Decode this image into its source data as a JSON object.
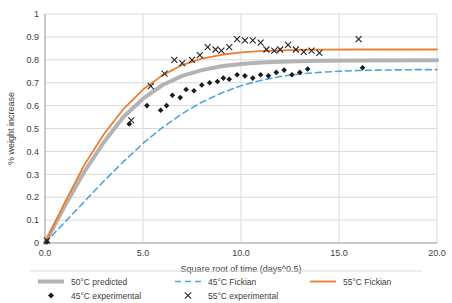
{
  "chart_data": {
    "type": "line",
    "title": "",
    "xlabel": "Square root of time (days^0.5)",
    "ylabel": "% weight increase",
    "xlim": [
      0.0,
      20.0
    ],
    "ylim": [
      0,
      1
    ],
    "xticks": [
      "0.0",
      "5.0",
      "10.0",
      "15.0",
      "20.0"
    ],
    "yticks": [
      "0",
      "0.1",
      "0.2",
      "0.3",
      "0.4",
      "0.5",
      "0.6",
      "0.7",
      "0.8",
      "0.9",
      "1"
    ],
    "grid": true,
    "legend_position": "bottom",
    "series": [
      {
        "name": "50°C predicted",
        "kind": "line",
        "color": "#b3b3b3",
        "width": 4,
        "points": [
          [
            0.0,
            0.0
          ],
          [
            1.0,
            0.16
          ],
          [
            2.0,
            0.31
          ],
          [
            3.0,
            0.44
          ],
          [
            4.0,
            0.55
          ],
          [
            5.0,
            0.63
          ],
          [
            6.0,
            0.69
          ],
          [
            7.0,
            0.73
          ],
          [
            8.0,
            0.755
          ],
          [
            9.0,
            0.772
          ],
          [
            10.0,
            0.782
          ],
          [
            11.0,
            0.788
          ],
          [
            12.0,
            0.792
          ],
          [
            13.0,
            0.794
          ],
          [
            14.0,
            0.796
          ],
          [
            16.0,
            0.797
          ],
          [
            20.0,
            0.798
          ]
        ]
      },
      {
        "name": "45°C Fickian",
        "kind": "dashed-line",
        "color": "#4ea6dc",
        "width": 1.6,
        "points": [
          [
            0.0,
            0.0
          ],
          [
            1.0,
            0.09
          ],
          [
            2.0,
            0.18
          ],
          [
            3.0,
            0.27
          ],
          [
            4.0,
            0.355
          ],
          [
            5.0,
            0.435
          ],
          [
            6.0,
            0.505
          ],
          [
            7.0,
            0.565
          ],
          [
            8.0,
            0.615
          ],
          [
            9.0,
            0.655
          ],
          [
            10.0,
            0.687
          ],
          [
            11.0,
            0.71
          ],
          [
            12.0,
            0.727
          ],
          [
            13.0,
            0.738
          ],
          [
            14.0,
            0.745
          ],
          [
            15.0,
            0.75
          ],
          [
            16.0,
            0.753
          ],
          [
            17.0,
            0.755
          ],
          [
            18.0,
            0.756
          ],
          [
            19.0,
            0.757
          ],
          [
            20.0,
            0.757
          ]
        ]
      },
      {
        "name": "55°C Fickian",
        "kind": "line",
        "color": "#ed7d31",
        "width": 1.8,
        "points": [
          [
            0.0,
            0.0
          ],
          [
            1.0,
            0.175
          ],
          [
            2.0,
            0.34
          ],
          [
            3.0,
            0.475
          ],
          [
            4.0,
            0.585
          ],
          [
            5.0,
            0.67
          ],
          [
            6.0,
            0.733
          ],
          [
            7.0,
            0.777
          ],
          [
            8.0,
            0.805
          ],
          [
            9.0,
            0.822
          ],
          [
            10.0,
            0.832
          ],
          [
            11.0,
            0.838
          ],
          [
            12.0,
            0.841
          ],
          [
            13.0,
            0.843
          ],
          [
            14.0,
            0.844
          ],
          [
            16.0,
            0.845
          ],
          [
            20.0,
            0.845
          ]
        ]
      },
      {
        "name": "45°C experimental",
        "kind": "scatter",
        "marker": "diamond",
        "color": "#1a1a1a",
        "points": [
          [
            0.1,
            0.005
          ],
          [
            4.3,
            0.52
          ],
          [
            5.2,
            0.6
          ],
          [
            5.9,
            0.58
          ],
          [
            6.2,
            0.6
          ],
          [
            6.5,
            0.645
          ],
          [
            6.9,
            0.635
          ],
          [
            7.2,
            0.67
          ],
          [
            7.6,
            0.665
          ],
          [
            8.0,
            0.69
          ],
          [
            8.4,
            0.7
          ],
          [
            8.8,
            0.705
          ],
          [
            9.1,
            0.72
          ],
          [
            9.4,
            0.715
          ],
          [
            9.8,
            0.735
          ],
          [
            10.2,
            0.73
          ],
          [
            10.6,
            0.72
          ],
          [
            11.0,
            0.735
          ],
          [
            11.4,
            0.73
          ],
          [
            11.8,
            0.745
          ],
          [
            12.2,
            0.755
          ],
          [
            12.6,
            0.735
          ],
          [
            13.0,
            0.745
          ],
          [
            13.4,
            0.76
          ],
          [
            16.2,
            0.765
          ]
        ]
      },
      {
        "name": "55°C experimental",
        "kind": "scatter",
        "marker": "cross",
        "color": "#262626",
        "points": [
          [
            0.1,
            0.01
          ],
          [
            4.4,
            0.535
          ],
          [
            5.4,
            0.685
          ],
          [
            6.1,
            0.74
          ],
          [
            6.6,
            0.8
          ],
          [
            7.0,
            0.785
          ],
          [
            7.5,
            0.8
          ],
          [
            7.9,
            0.82
          ],
          [
            8.3,
            0.855
          ],
          [
            8.7,
            0.845
          ],
          [
            9.0,
            0.84
          ],
          [
            9.4,
            0.855
          ],
          [
            9.8,
            0.89
          ],
          [
            10.2,
            0.885
          ],
          [
            10.6,
            0.885
          ],
          [
            11.0,
            0.875
          ],
          [
            11.3,
            0.845
          ],
          [
            11.7,
            0.84
          ],
          [
            12.0,
            0.845
          ],
          [
            12.4,
            0.865
          ],
          [
            12.8,
            0.845
          ],
          [
            13.2,
            0.835
          ],
          [
            13.6,
            0.84
          ],
          [
            14.0,
            0.83
          ],
          [
            16.0,
            0.89
          ]
        ]
      }
    ],
    "legend": [
      {
        "label": "50°C predicted",
        "kind": "line",
        "color": "#b3b3b3"
      },
      {
        "label": "45°C Fickian",
        "kind": "dashed-line",
        "color": "#4ea6dc"
      },
      {
        "label": "55°C Fickian",
        "kind": "line",
        "color": "#ed7d31"
      },
      {
        "label": "45°C experimental",
        "kind": "marker-diamond",
        "color": "#1a1a1a"
      },
      {
        "label": "55°C experimental",
        "kind": "marker-cross",
        "color": "#262626"
      }
    ]
  }
}
